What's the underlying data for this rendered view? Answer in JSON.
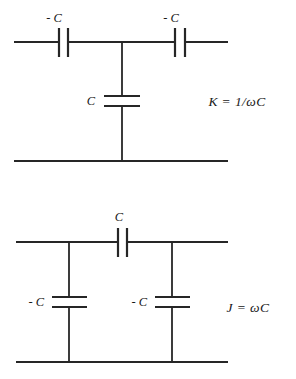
{
  "figure": {
    "stroke_color": "#262626",
    "background_color": "#ffffff",
    "text_color": "#171717"
  },
  "top_circuit": {
    "name": "t-network",
    "series_cap_left_label": "- C",
    "series_cap_right_label": "- C",
    "shunt_cap_label": "C",
    "formula": "K  =  1/ωC"
  },
  "bottom_circuit": {
    "name": "pi-network",
    "series_cap_label": "C",
    "shunt_cap_left_label": "- C",
    "shunt_cap_right_label": "- C",
    "formula": "J  =  ωC"
  }
}
